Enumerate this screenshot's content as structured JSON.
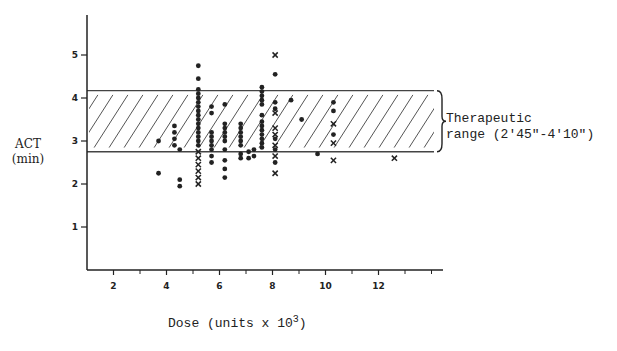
{
  "chart_data": {
    "type": "scatter",
    "title": "",
    "xlabel": "Dose (units x 10",
    "xlabel_superscript": "3",
    "xlabel_close": ")",
    "ylabel_line1": "ACT",
    "ylabel_line2": "(min)",
    "xlim": [
      1,
      14.5
    ],
    "ylim": [
      0,
      5.5
    ],
    "x_ticks": [
      2,
      4,
      6,
      8,
      10,
      12
    ],
    "x_minor_ticks": [
      3,
      5,
      7,
      9,
      11,
      13,
      14
    ],
    "y_ticks": [
      1,
      2,
      3,
      4,
      5
    ],
    "grid": false,
    "legend": null,
    "therapeutic_range": {
      "label_line1": "Therapeutic",
      "label_line2": "range (2'45\"-4'10\")",
      "lower": 2.75,
      "upper": 4.17,
      "hatched": true
    },
    "series": [
      {
        "name": "dots",
        "marker": "circle",
        "points": [
          [
            3.7,
            3.0
          ],
          [
            3.7,
            2.25
          ],
          [
            4.3,
            3.35
          ],
          [
            4.3,
            3.2
          ],
          [
            4.3,
            3.05
          ],
          [
            4.3,
            2.9
          ],
          [
            4.5,
            2.8
          ],
          [
            4.5,
            2.1
          ],
          [
            4.5,
            1.95
          ],
          [
            5.2,
            4.75
          ],
          [
            5.2,
            4.45
          ],
          [
            5.2,
            4.2
          ],
          [
            5.2,
            4.1
          ],
          [
            5.2,
            4.0
          ],
          [
            5.2,
            3.9
          ],
          [
            5.2,
            3.8
          ],
          [
            5.2,
            3.7
          ],
          [
            5.2,
            3.6
          ],
          [
            5.2,
            3.5
          ],
          [
            5.2,
            3.4
          ],
          [
            5.2,
            3.3
          ],
          [
            5.2,
            3.2
          ],
          [
            5.2,
            3.1
          ],
          [
            5.2,
            3.0
          ],
          [
            5.2,
            2.9
          ],
          [
            5.7,
            3.8
          ],
          [
            5.7,
            3.65
          ],
          [
            5.7,
            3.2
          ],
          [
            5.7,
            3.1
          ],
          [
            5.7,
            3.0
          ],
          [
            5.7,
            2.9
          ],
          [
            5.7,
            2.8
          ],
          [
            5.7,
            2.65
          ],
          [
            5.7,
            2.5
          ],
          [
            6.2,
            3.85
          ],
          [
            6.2,
            3.4
          ],
          [
            6.2,
            3.3
          ],
          [
            6.2,
            3.2
          ],
          [
            6.2,
            3.1
          ],
          [
            6.2,
            3.0
          ],
          [
            6.2,
            2.8
          ],
          [
            6.2,
            2.55
          ],
          [
            6.2,
            2.35
          ],
          [
            6.2,
            2.15
          ],
          [
            6.8,
            3.4
          ],
          [
            6.8,
            3.3
          ],
          [
            6.8,
            3.2
          ],
          [
            6.8,
            3.1
          ],
          [
            6.8,
            3.0
          ],
          [
            6.8,
            2.9
          ],
          [
            6.8,
            2.7
          ],
          [
            6.8,
            2.6
          ],
          [
            7.1,
            2.75
          ],
          [
            7.1,
            2.6
          ],
          [
            7.6,
            4.25
          ],
          [
            7.6,
            4.15
          ],
          [
            7.6,
            4.05
          ],
          [
            7.6,
            3.95
          ],
          [
            7.6,
            3.85
          ],
          [
            7.6,
            3.6
          ],
          [
            7.6,
            3.45
          ],
          [
            7.6,
            3.35
          ],
          [
            7.6,
            3.25
          ],
          [
            7.6,
            3.15
          ],
          [
            7.6,
            3.05
          ],
          [
            7.6,
            2.95
          ],
          [
            7.6,
            2.85
          ],
          [
            7.3,
            2.8
          ],
          [
            7.3,
            2.65
          ],
          [
            8.1,
            4.55
          ],
          [
            8.1,
            3.9
          ],
          [
            8.1,
            3.75
          ],
          [
            8.1,
            3.05
          ],
          [
            8.1,
            2.8
          ],
          [
            8.1,
            2.5
          ],
          [
            8.7,
            3.95
          ],
          [
            9.1,
            3.5
          ],
          [
            9.7,
            2.7
          ],
          [
            10.3,
            3.9
          ],
          [
            10.3,
            3.7
          ],
          [
            10.3,
            3.15
          ]
        ]
      },
      {
        "name": "crosses",
        "marker": "x",
        "points": [
          [
            5.2,
            2.75
          ],
          [
            5.2,
            2.6
          ],
          [
            5.2,
            2.45
          ],
          [
            5.2,
            2.3
          ],
          [
            5.2,
            2.15
          ],
          [
            5.2,
            2.0
          ],
          [
            8.1,
            5.0
          ],
          [
            8.1,
            3.65
          ],
          [
            8.1,
            3.3
          ],
          [
            8.1,
            3.15
          ],
          [
            8.1,
            2.9
          ],
          [
            8.1,
            2.65
          ],
          [
            8.1,
            2.25
          ],
          [
            10.3,
            3.4
          ],
          [
            10.3,
            2.95
          ],
          [
            10.3,
            2.55
          ],
          [
            12.6,
            2.6
          ]
        ]
      }
    ]
  },
  "layout": {
    "x_origin_px": 87,
    "x_end_px": 443,
    "px_per_x_unit": 26.5,
    "x_value_at_origin": 1,
    "y_zero_px": 270,
    "y_top_px": 15,
    "px_per_y_unit": 43,
    "ink_color": "#222222",
    "band_color": "#555555"
  }
}
